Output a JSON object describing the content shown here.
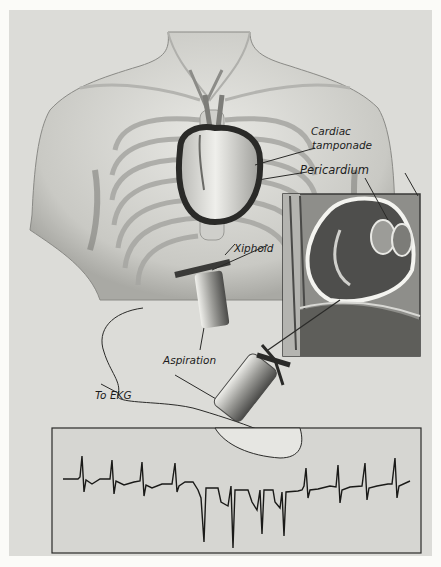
{
  "figure": {
    "colors": {
      "background": "#fbfbf8",
      "panel": "#dcdcd8",
      "ink": "#1c1c1c",
      "ekg_box": "#d6d6d2"
    },
    "labels": {
      "cardiac_tamponade_line1": "Cardiac",
      "cardiac_tamponade_line2": "tamponade",
      "pericardium": "Pericardium",
      "xiphoid": "Xiphoid",
      "aspiration": "Aspiration",
      "to_ekg": "To EKG"
    },
    "inset": {
      "description": "Cross-section of heart within pericardial sac"
    },
    "ekg": {
      "description": "EKG trace showing upright QRS complexes, then inverted deep complexes during needle contact, then upright again",
      "upright_beats_before": 4,
      "inverted_beats": 4,
      "upright_beats_after": 4
    }
  }
}
